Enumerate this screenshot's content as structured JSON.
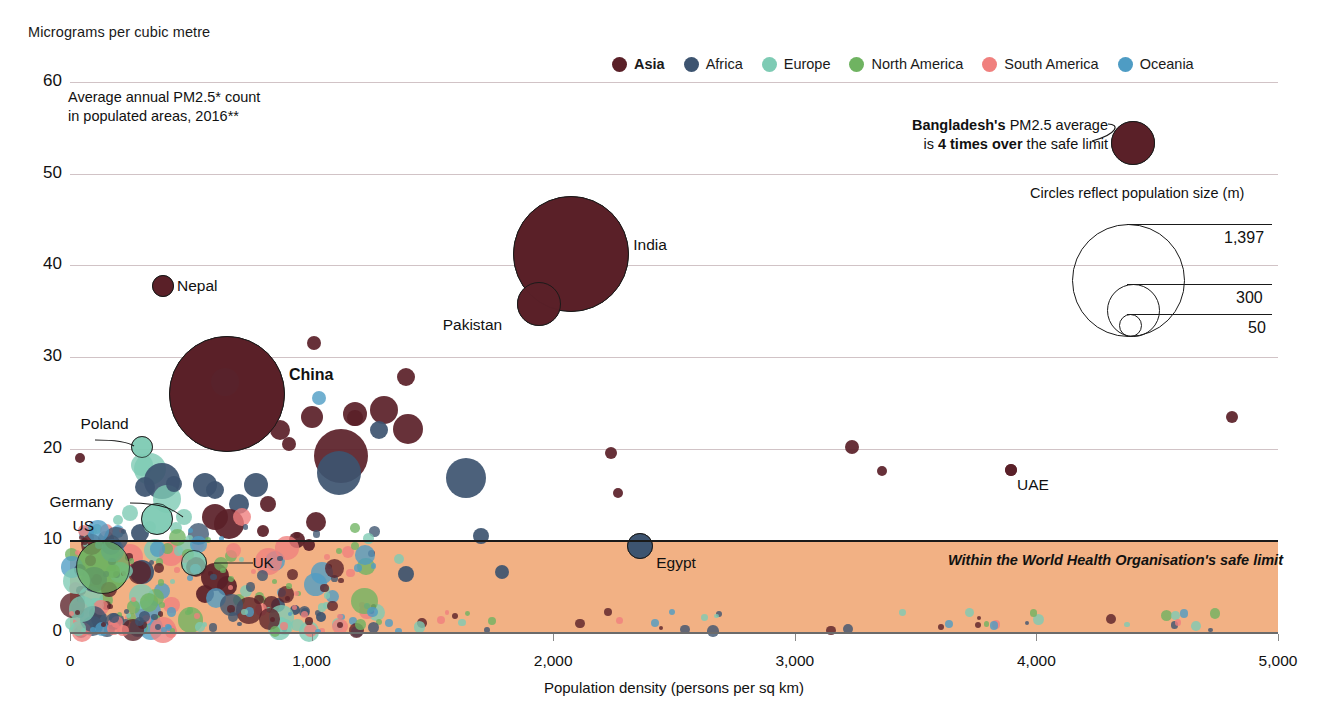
{
  "header": {
    "unit_label": "Micrograms per cubic metre"
  },
  "legend": {
    "items": [
      {
        "label": "Asia",
        "color": "#5a2028",
        "bold": true
      },
      {
        "label": "Africa",
        "color": "#3d5470",
        "bold": false
      },
      {
        "label": "Europe",
        "color": "#7ecbb4",
        "bold": false
      },
      {
        "label": "North America",
        "color": "#6fb361",
        "bold": false
      },
      {
        "label": "South America",
        "color": "#f0807e",
        "bold": false
      },
      {
        "label": "Oceania",
        "color": "#4e9cc4",
        "bold": false
      }
    ]
  },
  "subtitle": {
    "line1": "Average annual PM2.5* count",
    "line2": "in populated areas, 2016**"
  },
  "callout": {
    "line1_bold": "Bangladesh's",
    "line1_rest": " PM2.5 average",
    "line2_pre": "is ",
    "line2_bold": "4 times over",
    "line2_rest": " the safe limit"
  },
  "safe_band": {
    "text": "Within the World Health Organisation's safe limit",
    "color": "#f2b184",
    "upper_value": 10,
    "lower_value": 0
  },
  "population_legend": {
    "title": "Circles reflect population size (m)",
    "entries": [
      {
        "label": "1,397",
        "value": 1397
      },
      {
        "label": "300",
        "value": 300
      },
      {
        "label": "50",
        "value": 50
      }
    ]
  },
  "chart_data": {
    "type": "scatter",
    "title": "Average annual PM2.5* count in populated areas, 2016**",
    "xlabel": "Population density (persons per sq km)",
    "ylabel": "Micrograms per cubic metre",
    "xlim": [
      0,
      5000
    ],
    "ylim": [
      0,
      60
    ],
    "xticks": [
      0,
      1000,
      2000,
      3000,
      4000,
      5000
    ],
    "xticklabels": [
      "0",
      "1,000",
      "2,000",
      "3,000",
      "4,000",
      "5,000"
    ],
    "yticks": [
      0,
      10,
      20,
      30,
      40,
      50,
      60
    ],
    "yticklabels": [
      "0",
      "10",
      "20",
      "30",
      "40",
      "50",
      "60"
    ],
    "grid": "horizontal",
    "legend_position": "top-right",
    "size_encoding": "population_millions",
    "labeled_points": [
      {
        "name": "Bangladesh",
        "x": 4400,
        "y": 53.3,
        "pop": 163,
        "region": "Asia"
      },
      {
        "name": "India",
        "x": 2075,
        "y": 41.2,
        "pop": 1324,
        "region": "Asia"
      },
      {
        "name": "Pakistan",
        "x": 1940,
        "y": 35.8,
        "pop": 193,
        "region": "Asia"
      },
      {
        "name": "Nepal",
        "x": 385,
        "y": 37.8,
        "pop": 29,
        "region": "Asia"
      },
      {
        "name": "China",
        "x": 650,
        "y": 26.0,
        "pop": 1397,
        "region": "Asia"
      },
      {
        "name": "Poland",
        "x": 300,
        "y": 20.2,
        "pop": 38,
        "region": "Europe"
      },
      {
        "name": "Germany",
        "x": 362,
        "y": 12.3,
        "pop": 83,
        "region": "Europe"
      },
      {
        "name": "US",
        "x": 135,
        "y": 7.1,
        "pop": 323,
        "region": "North America"
      },
      {
        "name": "UK",
        "x": 515,
        "y": 7.5,
        "pop": 66,
        "region": "Europe"
      },
      {
        "name": "Egypt",
        "x": 2360,
        "y": 9.4,
        "pop": 95,
        "region": "Africa"
      },
      {
        "name": "UAE",
        "x": 3895,
        "y": 17.7,
        "pop": 9,
        "region": "Asia"
      }
    ],
    "points": [
      {
        "x": 4400,
        "y": 53.3,
        "r": 22,
        "region": "Asia"
      },
      {
        "x": 2075,
        "y": 41.2,
        "r": 58,
        "region": "Asia"
      },
      {
        "x": 1940,
        "y": 35.8,
        "r": 22,
        "region": "Asia"
      },
      {
        "x": 385,
        "y": 37.8,
        "r": 11,
        "region": "Asia"
      },
      {
        "x": 650,
        "y": 26.0,
        "r": 58,
        "region": "Asia"
      },
      {
        "x": 600,
        "y": 28.0,
        "r": 17,
        "region": "Asia"
      },
      {
        "x": 640,
        "y": 27.3,
        "r": 14,
        "region": "Africa"
      },
      {
        "x": 1010,
        "y": 31.5,
        "r": 7,
        "region": "Asia"
      },
      {
        "x": 1390,
        "y": 27.8,
        "r": 9,
        "region": "Asia"
      },
      {
        "x": 1180,
        "y": 23.8,
        "r": 12,
        "region": "Asia"
      },
      {
        "x": 1000,
        "y": 23.5,
        "r": 11,
        "region": "Asia"
      },
      {
        "x": 1300,
        "y": 24.2,
        "r": 14,
        "region": "Asia"
      },
      {
        "x": 1120,
        "y": 19.2,
        "r": 27,
        "region": "Asia"
      },
      {
        "x": 1115,
        "y": 17.4,
        "r": 22,
        "region": "Africa"
      },
      {
        "x": 1180,
        "y": 23.4,
        "r": 8,
        "region": "Asia"
      },
      {
        "x": 1400,
        "y": 22.2,
        "r": 15,
        "region": "Asia"
      },
      {
        "x": 1280,
        "y": 22.0,
        "r": 9,
        "region": "Africa"
      },
      {
        "x": 1640,
        "y": 16.8,
        "r": 20,
        "region": "Africa"
      },
      {
        "x": 1030,
        "y": 25.5,
        "r": 7,
        "region": "Oceania"
      },
      {
        "x": 870,
        "y": 22.0,
        "r": 10,
        "region": "Asia"
      },
      {
        "x": 905,
        "y": 20.5,
        "r": 7,
        "region": "Asia"
      },
      {
        "x": 2240,
        "y": 19.5,
        "r": 6,
        "region": "Asia"
      },
      {
        "x": 2270,
        "y": 15.2,
        "r": 5,
        "region": "Asia"
      },
      {
        "x": 3235,
        "y": 20.2,
        "r": 7,
        "region": "Asia"
      },
      {
        "x": 3360,
        "y": 17.6,
        "r": 5,
        "region": "Asia"
      },
      {
        "x": 3895,
        "y": 17.7,
        "r": 6,
        "region": "Asia"
      },
      {
        "x": 4810,
        "y": 23.5,
        "r": 6,
        "region": "Asia"
      },
      {
        "x": 300,
        "y": 20.2,
        "r": 11,
        "region": "Europe"
      },
      {
        "x": 40,
        "y": 19.0,
        "r": 5,
        "region": "Asia"
      },
      {
        "x": 362,
        "y": 12.3,
        "r": 16,
        "region": "Europe"
      },
      {
        "x": 135,
        "y": 7.1,
        "r": 27,
        "region": "North America"
      },
      {
        "x": 515,
        "y": 7.5,
        "r": 13,
        "region": "Europe"
      },
      {
        "x": 2360,
        "y": 9.4,
        "r": 13,
        "region": "Africa"
      },
      {
        "x": 330,
        "y": 17.8,
        "r": 16,
        "region": "Europe"
      },
      {
        "x": 300,
        "y": 18.2,
        "r": 11,
        "region": "Europe"
      },
      {
        "x": 380,
        "y": 16.5,
        "r": 18,
        "region": "Africa"
      },
      {
        "x": 400,
        "y": 14.5,
        "r": 14,
        "region": "Europe"
      },
      {
        "x": 310,
        "y": 15.8,
        "r": 10,
        "region": "Africa"
      },
      {
        "x": 430,
        "y": 16.2,
        "r": 8,
        "region": "Africa"
      },
      {
        "x": 560,
        "y": 16.0,
        "r": 12,
        "region": "Africa"
      },
      {
        "x": 600,
        "y": 15.5,
        "r": 9,
        "region": "Africa"
      },
      {
        "x": 700,
        "y": 14.0,
        "r": 10,
        "region": "Africa"
      },
      {
        "x": 770,
        "y": 16.0,
        "r": 12,
        "region": "Africa"
      },
      {
        "x": 820,
        "y": 14.0,
        "r": 8,
        "region": "Asia"
      },
      {
        "x": 600,
        "y": 12.5,
        "r": 13,
        "region": "Asia"
      },
      {
        "x": 660,
        "y": 11.8,
        "r": 15,
        "region": "Asia"
      },
      {
        "x": 710,
        "y": 12.6,
        "r": 9,
        "region": "South America"
      },
      {
        "x": 800,
        "y": 11.0,
        "r": 6,
        "region": "Asia"
      },
      {
        "x": 250,
        "y": 13.0,
        "r": 8,
        "region": "Europe"
      },
      {
        "x": 200,
        "y": 12.2,
        "r": 5,
        "region": "Europe"
      },
      {
        "x": 290,
        "y": 10.8,
        "r": 9,
        "region": "Africa"
      },
      {
        "x": 330,
        "y": 11.5,
        "r": 6,
        "region": "Europe"
      },
      {
        "x": 110,
        "y": 11.2,
        "r": 5,
        "region": "Europe"
      },
      {
        "x": 440,
        "y": 11.4,
        "r": 6,
        "region": "Europe"
      },
      {
        "x": 470,
        "y": 12.5,
        "r": 8,
        "region": "Europe"
      },
      {
        "x": 940,
        "y": 10.0,
        "r": 8,
        "region": "Asia"
      },
      {
        "x": 1020,
        "y": 12.0,
        "r": 10,
        "region": "Asia"
      },
      {
        "x": 990,
        "y": 9.5,
        "r": 6,
        "region": "Asia"
      },
      {
        "x": 1700,
        "y": 10.5,
        "r": 8,
        "region": "Africa"
      },
      {
        "x": 1360,
        "y": 8.0,
        "r": 5,
        "region": "Europe"
      },
      {
        "x": 1390,
        "y": 6.3,
        "r": 8,
        "region": "Africa"
      },
      {
        "x": 1790,
        "y": 6.5,
        "r": 7,
        "region": "Africa"
      },
      {
        "x": 350,
        "y": 9.0,
        "r": 11,
        "region": "Europe"
      },
      {
        "x": 420,
        "y": 8.5,
        "r": 12,
        "region": "South America"
      },
      {
        "x": 480,
        "y": 9.2,
        "r": 9,
        "region": "Europe"
      },
      {
        "x": 530,
        "y": 9.5,
        "r": 6,
        "region": "South America"
      },
      {
        "x": 250,
        "y": 8.2,
        "r": 13,
        "region": "South America"
      },
      {
        "x": 210,
        "y": 6.5,
        "r": 10,
        "region": "Europe"
      },
      {
        "x": 300,
        "y": 6.5,
        "r": 12,
        "region": "Africa"
      },
      {
        "x": 600,
        "y": 6.0,
        "r": 14,
        "region": "Asia"
      },
      {
        "x": 650,
        "y": 5.0,
        "r": 10,
        "region": "Asia"
      },
      {
        "x": 560,
        "y": 4.2,
        "r": 9,
        "region": "Asia"
      },
      {
        "x": 380,
        "y": 4.5,
        "r": 8,
        "region": "Oceania"
      },
      {
        "x": 150,
        "y": 3.5,
        "r": 7,
        "region": "North America"
      },
      {
        "x": 90,
        "y": 2.5,
        "r": 6,
        "region": "Oceania"
      },
      {
        "x": 700,
        "y": 3.5,
        "r": 6,
        "region": "North America"
      },
      {
        "x": 860,
        "y": 3.0,
        "r": 7,
        "region": "Africa"
      },
      {
        "x": 930,
        "y": 2.4,
        "r": 5,
        "region": "Africa"
      },
      {
        "x": 1040,
        "y": 1.6,
        "r": 5,
        "region": "Africa"
      },
      {
        "x": 1170,
        "y": 1.2,
        "r": 4,
        "region": "Oceania"
      },
      {
        "x": 2420,
        "y": 1.0,
        "r": 4,
        "region": "Oceania"
      },
      {
        "x": 3640,
        "y": 0.9,
        "r": 4,
        "region": "Oceania"
      },
      {
        "x": 1320,
        "y": 1.0,
        "r": 4,
        "region": "Oceania"
      }
    ]
  },
  "axis": {
    "y_values": [
      "60",
      "50",
      "40",
      "30",
      "20",
      "10",
      "0"
    ],
    "x_values": [
      "0",
      "1,000",
      "2,000",
      "3,000",
      "4,000",
      "5,000"
    ]
  }
}
